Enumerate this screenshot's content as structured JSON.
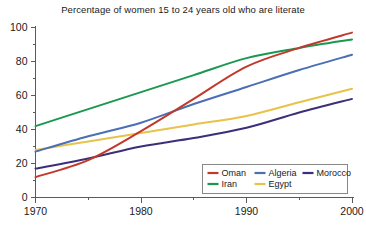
{
  "chart_data": {
    "type": "line",
    "title": "Percentage of women 15 to 24 years old who are literate",
    "xlabel": "",
    "ylabel": "",
    "x": [
      1970,
      1975,
      1980,
      1985,
      1990,
      1995,
      2000
    ],
    "xlim": [
      1970,
      2000
    ],
    "ylim": [
      0,
      100
    ],
    "x_tick_labels": [
      "1970",
      "1980",
      "1990",
      "2000"
    ],
    "x_tick_values": [
      1970,
      1980,
      1990,
      2000
    ],
    "x_minor_tick_values": [
      1975,
      1985,
      1995
    ],
    "y_tick_labels": [
      "0",
      "20",
      "40",
      "60",
      "80",
      "100"
    ],
    "y_tick_values": [
      0,
      20,
      40,
      60,
      80,
      100
    ],
    "y_minor_tick_values": [
      10,
      30,
      50,
      70,
      90
    ],
    "grid": false,
    "legend_position": "lower right",
    "series": [
      {
        "name": "Oman",
        "color": "#c0392b",
        "values": [
          12,
          22,
          39,
          58,
          77,
          88,
          97
        ]
      },
      {
        "name": "Iran",
        "color": "#1a9850",
        "values": [
          42,
          52,
          62,
          72,
          82,
          88,
          93
        ]
      },
      {
        "name": "Algeria",
        "color": "#4a6fb5",
        "values": [
          27,
          36,
          44,
          55,
          65,
          75,
          84
        ]
      },
      {
        "name": "Egypt",
        "color": "#e8c24a",
        "values": [
          28,
          33,
          38,
          43,
          48,
          56,
          64
        ]
      },
      {
        "name": "Morocco",
        "color": "#3b2f7a",
        "values": [
          17,
          23,
          30,
          35,
          41,
          50,
          58
        ]
      }
    ],
    "legend_order": [
      "Oman",
      "Algeria",
      "Morocco",
      "Iran",
      "Egypt"
    ]
  },
  "axes": {
    "spine_color": "#5a5a5a",
    "background": "#ffffff"
  }
}
